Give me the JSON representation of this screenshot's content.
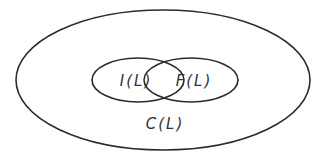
{
  "diagram": {
    "type": "venn",
    "outer": {
      "label": "C(L)",
      "shape": "ellipse",
      "cx": 163,
      "cy": 80,
      "rx": 147,
      "ry": 70
    },
    "sets": [
      {
        "label": "I(L)",
        "shape": "ellipse",
        "cx": 138,
        "cy": 80,
        "rx": 46,
        "ry": 22
      },
      {
        "label": "F(L)",
        "shape": "ellipse",
        "cx": 191,
        "cy": 80,
        "rx": 47,
        "ry": 22
      }
    ],
    "relationship": "I(L) and F(L) overlap, both contained in C(L)",
    "stroke_color": "#2b2b2b",
    "background_color": "#ffffff"
  }
}
